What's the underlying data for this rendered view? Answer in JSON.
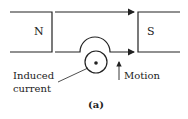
{
  "diagram": {
    "north_label": "N",
    "south_label": "S",
    "induced_label_line1": "Induced",
    "induced_label_line2": "current",
    "motion_label": "Motion",
    "caption": "(a)",
    "stroke_color": "#222222"
  }
}
